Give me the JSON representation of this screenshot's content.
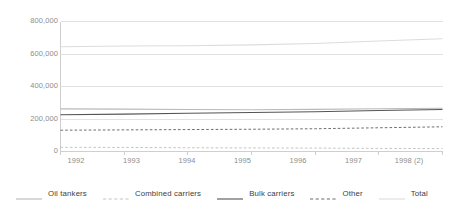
{
  "chart_data": {
    "type": "line",
    "title": "",
    "subtitle": "",
    "xlabel": "",
    "ylabel": "",
    "x": [
      "1992",
      "1993",
      "1994",
      "1995",
      "1996",
      "1997",
      "1998 (2)"
    ],
    "xtick_labels": [
      "1992",
      "1993",
      "1994",
      "1995",
      "1996",
      "1997",
      "1998 (2)"
    ],
    "ytick_labels": [
      "0",
      "200,000",
      "400,000",
      "600,000",
      "800,000"
    ],
    "ytick_values": [
      0,
      200000,
      400000,
      600000,
      800000
    ],
    "ylim": [
      0,
      800000
    ],
    "grid": true,
    "grid_axis": "y",
    "legend_position": "bottom",
    "series": [
      {
        "name": "Oil tankers",
        "color": "#b9b9b9",
        "style": "solid",
        "width": 1.1,
        "values": [
          262000,
          261000,
          258000,
          257000,
          259000,
          263000,
          266000
        ]
      },
      {
        "name": "Combined carriers",
        "color": "#c4c4c4",
        "style": "dashed",
        "width": 1.0,
        "values": [
          26000,
          25000,
          23000,
          22000,
          21000,
          19000,
          18000
        ]
      },
      {
        "name": "Bulk carriers",
        "color": "#545454",
        "style": "solid",
        "width": 1.1,
        "values": [
          226000,
          230000,
          235000,
          240000,
          245000,
          252000,
          258000
        ]
      },
      {
        "name": "Other",
        "color": "#6d6d6d",
        "style": "dashed",
        "width": 1.0,
        "values": [
          131000,
          133000,
          135000,
          137000,
          140000,
          146000,
          152000
        ]
      },
      {
        "name": "Total",
        "color": "#dcdcdc",
        "style": "solid",
        "width": 1.1,
        "values": [
          645000,
          649000,
          651000,
          656000,
          665000,
          680000,
          694000
        ]
      }
    ]
  },
  "legend": {
    "items": [
      {
        "label": "Oil tankers"
      },
      {
        "label": "Combined carriers"
      },
      {
        "label": "Bulk carriers"
      },
      {
        "label": "Other"
      },
      {
        "label": "Total"
      }
    ]
  },
  "axes": {
    "y_tick_0": "0",
    "y_tick_1": "200,000",
    "y_tick_2": "400,000",
    "y_tick_3": "600,000",
    "y_tick_4": "800,000",
    "x_tick_0": "1992",
    "x_tick_1": "1993",
    "x_tick_2": "1994",
    "x_tick_3": "1995",
    "x_tick_4": "1996",
    "x_tick_5": "1997",
    "x_tick_6": "1998 (2)"
  },
  "colors": {
    "grid": "#e2e2e2",
    "axis": "#cfcfcf",
    "tick_text": "#8d8d8d",
    "legend_text": "#3d3d3d",
    "background": "#ffffff"
  }
}
